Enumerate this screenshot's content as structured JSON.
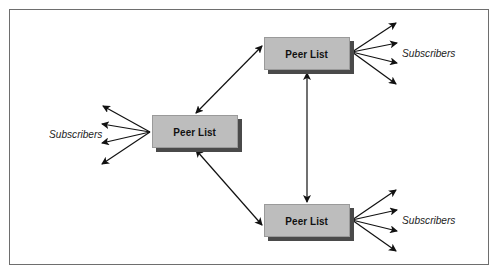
{
  "diagram": {
    "nodes": [
      {
        "id": "top",
        "label": "Peer List",
        "x": 264,
        "y": 37
      },
      {
        "id": "middle",
        "label": "Peer List",
        "x": 152,
        "y": 115
      },
      {
        "id": "bottom",
        "label": "Peer List",
        "x": 264,
        "y": 204
      }
    ],
    "subscriber_labels": [
      {
        "id": "top",
        "label": "Subscribers",
        "x": 402,
        "y": 47
      },
      {
        "id": "middle",
        "label": "Subscribers",
        "x": 49,
        "y": 128
      },
      {
        "id": "bottom",
        "label": "Subscribers",
        "x": 402,
        "y": 214
      }
    ],
    "edges": [
      {
        "from": "middle",
        "to": "top",
        "type": "bidirectional"
      },
      {
        "from": "middle",
        "to": "bottom",
        "type": "bidirectional"
      },
      {
        "from": "top",
        "to": "bottom",
        "type": "bidirectional"
      }
    ],
    "fan_outs": [
      {
        "node": "top",
        "arrows": 4,
        "direction": "right"
      },
      {
        "node": "middle",
        "arrows": 4,
        "direction": "left"
      },
      {
        "node": "bottom",
        "arrows": 4,
        "direction": "right"
      }
    ],
    "colors": {
      "box_fill": "#bdbdbd",
      "box_shadow": "#4a4a4a",
      "arrow": "#111111",
      "frame": "#6e6e6e"
    }
  }
}
